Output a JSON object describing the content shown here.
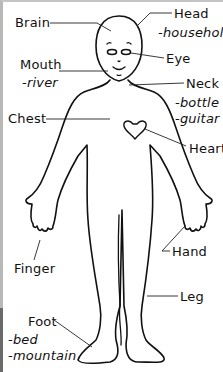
{
  "diagram": {
    "type": "labeled body parts illustration",
    "labels": [
      {
        "id": "brain",
        "text": "Brain",
        "x": 15,
        "y": 16
      },
      {
        "id": "head",
        "text": "Head",
        "x": 174,
        "y": 7
      },
      {
        "id": "head-sub",
        "text": "-household",
        "x": 158,
        "y": 26
      },
      {
        "id": "eye",
        "text": "Eye",
        "x": 166,
        "y": 52
      },
      {
        "id": "mouth",
        "text": "Mouth",
        "x": 20,
        "y": 58
      },
      {
        "id": "mouth-sub",
        "text": "-river",
        "x": 22,
        "y": 76
      },
      {
        "id": "neck",
        "text": "Neck",
        "x": 186,
        "y": 77
      },
      {
        "id": "neck-sub",
        "text": "-bottle",
        "x": 175,
        "y": 96
      },
      {
        "id": "neck-sub2",
        "text": "-guitar",
        "x": 175,
        "y": 112
      },
      {
        "id": "chest",
        "text": "Chest",
        "x": 8,
        "y": 112
      },
      {
        "id": "heart",
        "text": "Heart",
        "x": 189,
        "y": 142
      },
      {
        "id": "hand",
        "text": "Hand",
        "x": 172,
        "y": 245
      },
      {
        "id": "finger",
        "text": "Finger",
        "x": 14,
        "y": 262
      },
      {
        "id": "leg",
        "text": "Leg",
        "x": 180,
        "y": 290
      },
      {
        "id": "foot",
        "text": "Foot",
        "x": 28,
        "y": 315
      },
      {
        "id": "foot-sub",
        "text": "-bed",
        "x": 8,
        "y": 333
      },
      {
        "id": "foot-sub2",
        "text": "-mountain",
        "x": 8,
        "y": 349
      }
    ]
  }
}
